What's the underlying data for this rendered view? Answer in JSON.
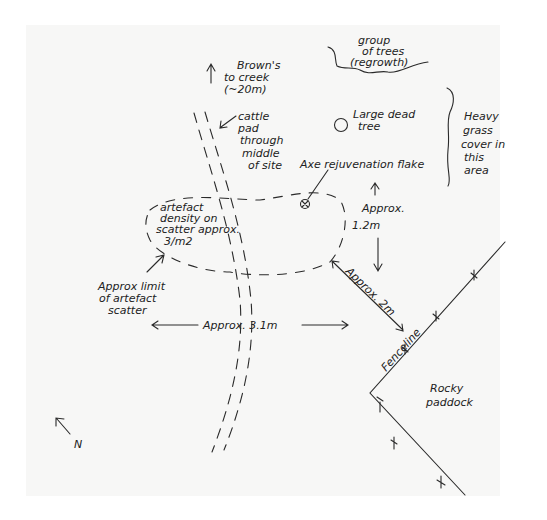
{
  "diagram": {
    "type": "hand-drawn site sketch map",
    "labels": {
      "creek": [
        "Brown's",
        "to creek",
        "(~20m)"
      ],
      "cattle_pad": [
        "cattle",
        "pad",
        "through",
        "middle",
        "of site"
      ],
      "tree_group": [
        "group",
        "of trees",
        "(regrowth)"
      ],
      "dead_tree": [
        "Large dead",
        "tree"
      ],
      "grass": [
        "Heavy",
        "grass",
        "cover in",
        "this",
        "area"
      ],
      "axe_flake": "Axe rejuvenation flake",
      "density": [
        "artefact",
        "density on",
        "scatter approx.",
        "3/m2"
      ],
      "scatter_limit": [
        "Approx limit",
        "of artefact",
        "scatter"
      ],
      "dist_vertical": [
        "Approx.",
        "1.2m"
      ],
      "dist_diagonal": "Approx. 2m",
      "dist_horizontal": "Approx. 3.1m",
      "fenceline": "Fenceline",
      "paddock": [
        "Rocky",
        "paddock"
      ],
      "north": "N"
    }
  }
}
